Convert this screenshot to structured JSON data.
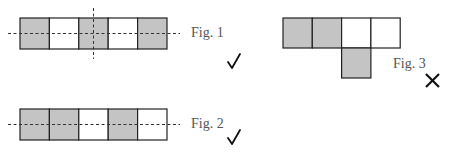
{
  "colors": {
    "shaded": "#c4c4c4",
    "unshaded": "#ffffff",
    "stroke": "#222222",
    "dash": "#333333"
  },
  "figures": [
    {
      "label": "Fig. 1",
      "cells": [
        1,
        0,
        1,
        0,
        1
      ],
      "verdict": "check",
      "verdict_glyph": "✓",
      "axes": [
        "horizontal",
        "vertical"
      ]
    },
    {
      "label": "Fig. 2",
      "cells": [
        1,
        1,
        0,
        1,
        0
      ],
      "verdict": "check",
      "verdict_glyph": "✓",
      "axes": [
        "horizontal"
      ]
    },
    {
      "label": "Fig. 3",
      "top_row": [
        1,
        1,
        0,
        0
      ],
      "bottom_cell": 1,
      "verdict": "cross",
      "verdict_glyph": "✕",
      "axes": []
    }
  ]
}
